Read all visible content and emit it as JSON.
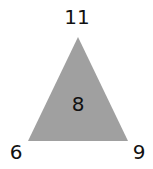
{
  "puzzle": {
    "top": "11",
    "left": "6",
    "right": "9",
    "center": "8",
    "fill_color": "#a0a0a0"
  }
}
